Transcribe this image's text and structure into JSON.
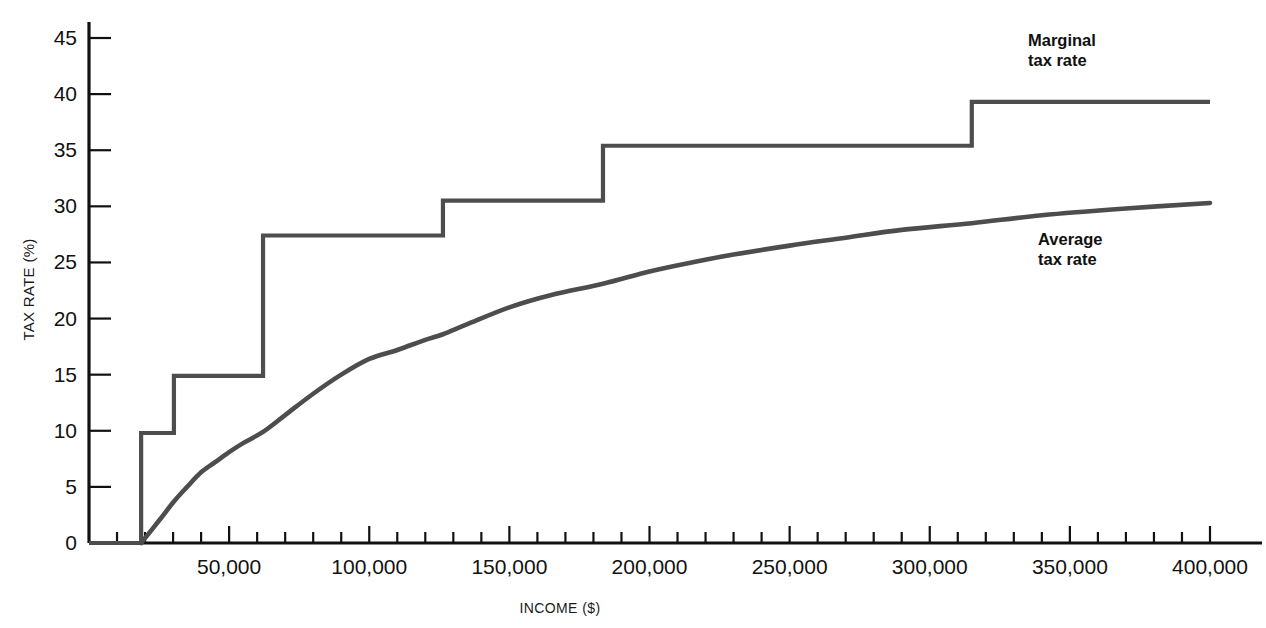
{
  "chart_data": {
    "type": "line",
    "title": "",
    "xlabel": "INCOME ($)",
    "ylabel": "TAX RATE (%)",
    "xlim": [
      0,
      400000
    ],
    "ylim": [
      0,
      45
    ],
    "grid": false,
    "legend_position": "inline-annotations",
    "x_tick_labels": [
      "50,000",
      "100,000",
      "150,000",
      "200,000",
      "250,000",
      "300,000",
      "350,000",
      "400,000"
    ],
    "x_major_ticks": [
      50000,
      100000,
      150000,
      200000,
      250000,
      300000,
      350000,
      400000
    ],
    "x_minor_tick_interval": 10000,
    "y_tick_labels": [
      "0",
      "5",
      "10",
      "15",
      "20",
      "25",
      "30",
      "35",
      "40",
      "45"
    ],
    "y_major_ticks": [
      0,
      5,
      10,
      15,
      20,
      25,
      30,
      35,
      40,
      45
    ],
    "line_color": "#4d4d4d",
    "axis_color": "#111111",
    "series": [
      {
        "name": "Marginal tax rate",
        "style": "step",
        "annotation": "Marginal\ntax rate",
        "annotation_line1": "Marginal",
        "annotation_line2": "tax rate",
        "brackets": [
          {
            "income_start": 0,
            "income_end": 18600,
            "rate": 0.0
          },
          {
            "income_start": 18600,
            "income_end": 30300,
            "rate": 9.8
          },
          {
            "income_start": 30300,
            "income_end": 62100,
            "rate": 14.9
          },
          {
            "income_start": 62100,
            "income_end": 126300,
            "rate": 27.4
          },
          {
            "income_start": 126300,
            "income_end": 183400,
            "rate": 30.5
          },
          {
            "income_start": 183400,
            "income_end": 315000,
            "rate": 35.4
          },
          {
            "income_start": 315000,
            "income_end": 400000,
            "rate": 39.3
          }
        ]
      },
      {
        "name": "Average tax rate",
        "style": "curve",
        "annotation_line1": "Average",
        "annotation_line2": "tax rate",
        "points": [
          {
            "x": 18600,
            "y": 0.0
          },
          {
            "x": 25000,
            "y": 2.0
          },
          {
            "x": 30300,
            "y": 3.7
          },
          {
            "x": 35000,
            "y": 5.0
          },
          {
            "x": 40000,
            "y": 6.3
          },
          {
            "x": 45000,
            "y": 7.2
          },
          {
            "x": 50000,
            "y": 8.1
          },
          {
            "x": 55000,
            "y": 8.9
          },
          {
            "x": 62100,
            "y": 9.9
          },
          {
            "x": 70000,
            "y": 11.4
          },
          {
            "x": 80000,
            "y": 13.3
          },
          {
            "x": 90000,
            "y": 15.0
          },
          {
            "x": 100000,
            "y": 16.4
          },
          {
            "x": 110000,
            "y": 17.2
          },
          {
            "x": 120000,
            "y": 18.1
          },
          {
            "x": 126300,
            "y": 18.6
          },
          {
            "x": 135000,
            "y": 19.5
          },
          {
            "x": 150000,
            "y": 21.0
          },
          {
            "x": 165000,
            "y": 22.1
          },
          {
            "x": 183400,
            "y": 23.1
          },
          {
            "x": 200000,
            "y": 24.2
          },
          {
            "x": 215000,
            "y": 25.0
          },
          {
            "x": 230000,
            "y": 25.7
          },
          {
            "x": 250000,
            "y": 26.5
          },
          {
            "x": 270000,
            "y": 27.2
          },
          {
            "x": 290000,
            "y": 27.9
          },
          {
            "x": 315000,
            "y": 28.5
          },
          {
            "x": 340000,
            "y": 29.2
          },
          {
            "x": 370000,
            "y": 29.8
          },
          {
            "x": 400000,
            "y": 30.3
          }
        ]
      }
    ]
  }
}
